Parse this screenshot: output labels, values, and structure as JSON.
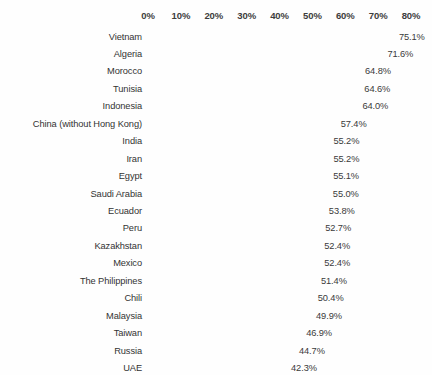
{
  "chart_data": {
    "type": "bar",
    "orientation": "horizontal",
    "title": "",
    "subtitle": "",
    "xlabel": "",
    "ylabel": "",
    "xlim": [
      0,
      80
    ],
    "grid": false,
    "legend": false,
    "axis_position": "top",
    "value_label_suffix": "%",
    "bar_color": "#5e5e5e",
    "text_color": "#333333",
    "background_color": "#fefefe",
    "tick_labels": [
      "0%",
      "10%",
      "20%",
      "30%",
      "40%",
      "50%",
      "60%",
      "70%",
      "80%"
    ],
    "tick_values": [
      0,
      10,
      20,
      30,
      40,
      50,
      60,
      70,
      80
    ],
    "categories": [
      "Vietnam",
      "Algeria",
      "Morocco",
      "Tunisia",
      "Indonesia",
      "China (without Hong Kong)",
      "India",
      "Iran",
      "Egypt",
      "Saudi Arabia",
      "Ecuador",
      "Peru",
      "Kazakhstan",
      "Mexico",
      "The Philippines",
      "Chili",
      "Malaysia",
      "Taiwan",
      "Russia",
      "UAE"
    ],
    "values": [
      75.1,
      71.6,
      64.8,
      64.6,
      64.0,
      57.4,
      55.2,
      55.2,
      55.1,
      55.0,
      53.8,
      52.7,
      52.4,
      52.4,
      51.4,
      50.4,
      49.9,
      46.9,
      44.7,
      42.3
    ],
    "value_labels": [
      "75.1%",
      "71.6%",
      "64.8%",
      "64.6%",
      "64.0%",
      "57.4%",
      "55.2%",
      "55.2%",
      "55.1%",
      "55.0%",
      "53.8%",
      "52.7%",
      "52.4%",
      "52.4%",
      "51.4%",
      "50.4%",
      "49.9%",
      "46.9%",
      "44.7%",
      "42.3%"
    ]
  }
}
